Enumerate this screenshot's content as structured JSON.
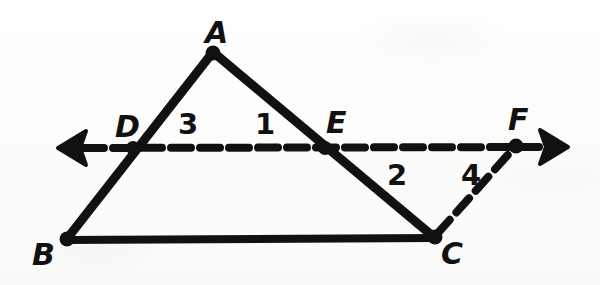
{
  "figure": {
    "kind": "geometry-diagram",
    "ink_color": "#111111",
    "background_color": "#fdfdfc",
    "width": 600,
    "height": 285
  },
  "points": [
    {
      "id": "A",
      "label": "A",
      "x": 213,
      "y": 52,
      "label_x": 205,
      "label_y": 18,
      "dot": true
    },
    {
      "id": "B",
      "label": "B",
      "x": 66,
      "y": 240,
      "label_x": 32,
      "label_y": 240,
      "dot": true
    },
    {
      "id": "C",
      "label": "C",
      "x": 435,
      "y": 238,
      "label_x": 441,
      "label_y": 239,
      "dot": true
    },
    {
      "id": "D",
      "label": "D",
      "x": 133,
      "y": 148,
      "label_x": 115,
      "label_y": 112,
      "dot": true
    },
    {
      "id": "E",
      "label": "E",
      "x": 325,
      "y": 148,
      "label_x": 326,
      "label_y": 108,
      "dot": true
    },
    {
      "id": "F",
      "label": "F",
      "x": 516,
      "y": 146,
      "label_x": 508,
      "label_y": 105,
      "dot": true
    }
  ],
  "segments": [
    {
      "id": "AB",
      "from": "A",
      "to": "B",
      "style": "solid",
      "width": 9
    },
    {
      "id": "AC",
      "from": "A",
      "to": "C",
      "style": "solid",
      "width": 9
    },
    {
      "id": "BC",
      "from": "B",
      "to": "C",
      "style": "solid",
      "width": 8
    },
    {
      "id": "DF",
      "from": "D",
      "to": "F",
      "style": "dashed",
      "width": 8,
      "extends": "both"
    },
    {
      "id": "CF",
      "from": "C",
      "to": "F",
      "style": "dashed",
      "width": 8
    }
  ],
  "arrows": [
    {
      "id": "left-arrow",
      "x": 72,
      "y": 148,
      "direction": "left"
    },
    {
      "id": "right-arrow",
      "x": 553,
      "y": 147,
      "direction": "right"
    }
  ],
  "angle_labels": [
    {
      "id": "angle-1",
      "label": "1",
      "x": 262,
      "y": 126
    },
    {
      "id": "angle-2",
      "label": "2",
      "x": 394,
      "y": 177
    },
    {
      "id": "angle-3",
      "label": "3",
      "x": 186,
      "y": 126
    },
    {
      "id": "angle-4",
      "label": "4",
      "x": 468,
      "y": 177
    }
  ],
  "font_sizes": {
    "vertex_label": 30,
    "angle_label": 29
  }
}
